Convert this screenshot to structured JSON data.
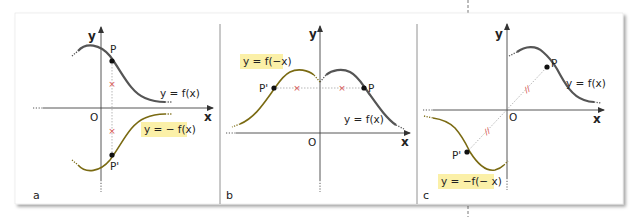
{
  "colors": {
    "curve_original": "#555555",
    "curve_transformed": "#7a6a12",
    "highlight_bg": "#fbf0a8",
    "mark": "#d9534f",
    "axis": "#444444",
    "dotted_guide": "#999999"
  },
  "panels": [
    {
      "id": "a",
      "label": "a",
      "axes": {
        "x_label": "x",
        "y_label": "y",
        "origin_label": "O"
      },
      "point_original": "P",
      "point_transformed": "P'",
      "curve_original_label": "y = f(x)",
      "curve_transformed_label": "y = − f(x)",
      "symmetry": "reflection across x-axis",
      "equal_marks": "×"
    },
    {
      "id": "b",
      "label": "b",
      "axes": {
        "x_label": "x",
        "y_label": "y",
        "origin_label": "O"
      },
      "point_original": "P",
      "point_transformed": "P'",
      "curve_original_label": "y = f(x)",
      "curve_transformed_label": "y = f(−x)",
      "symmetry": "reflection across y-axis",
      "equal_marks": "×"
    },
    {
      "id": "c",
      "label": "c",
      "axes": {
        "x_label": "x",
        "y_label": "y",
        "origin_label": "O"
      },
      "point_original": "P",
      "point_transformed": "P'",
      "curve_original_label": "y = f(x)",
      "curve_transformed_label": "y = −f(− x)",
      "symmetry": "point reflection through origin",
      "equal_marks": "//"
    }
  ]
}
